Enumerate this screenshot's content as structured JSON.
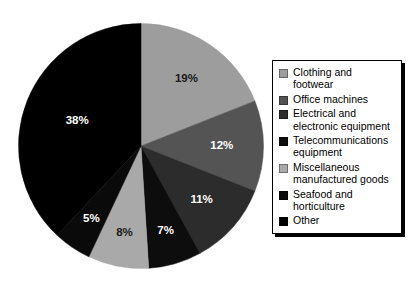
{
  "chart_data": {
    "type": "pie",
    "title": "",
    "subtitle": "",
    "xlabel": "",
    "ylabel": "",
    "grid": false,
    "legend_position": "right",
    "start_angle_deg": 0,
    "direction": "clockwise",
    "units": "percent",
    "total": 100,
    "categories": [
      "Clothing and footwear",
      "Office machines",
      "Electrical and electronic equipment",
      "Telecommunications equipment",
      "Miscellaneous manufactured goods",
      "Seafood and horticulture",
      "Other"
    ],
    "values": [
      19,
      12,
      11,
      7,
      8,
      5,
      38
    ],
    "data_labels": [
      "19%",
      "12%",
      "11%",
      "7%",
      "8%",
      "5%",
      "38%"
    ],
    "colors": [
      "#9d9d9d",
      "#545454",
      "#2c2c2c",
      "#0d0d0d",
      "#a9a9a9",
      "#0a0a0a",
      "#000000"
    ],
    "label_text_colors": [
      "#1a1a1a",
      "#ffffff",
      "#ffffff",
      "#ffffff",
      "#1a1a1a",
      "#ffffff",
      "#ffffff"
    ],
    "slices": [
      {
        "label": "Clothing and footwear",
        "value": 19,
        "data_label": "19%",
        "color": "#9d9d9d",
        "label_color": "#1a1a1a"
      },
      {
        "label": "Office machines",
        "value": 12,
        "data_label": "12%",
        "color": "#545454",
        "label_color": "#ffffff"
      },
      {
        "label": "Electrical and electronic equipment",
        "value": 11,
        "data_label": "11%",
        "color": "#2c2c2c",
        "label_color": "#ffffff"
      },
      {
        "label": "Telecommunications equipment",
        "value": 7,
        "data_label": "7%",
        "color": "#0d0d0d",
        "label_color": "#ffffff"
      },
      {
        "label": "Miscellaneous manufactured goods",
        "value": 8,
        "data_label": "8%",
        "color": "#a9a9a9",
        "label_color": "#1a1a1a"
      },
      {
        "label": "Seafood and horticulture",
        "value": 5,
        "data_label": "5%",
        "color": "#0a0a0a",
        "label_color": "#ffffff"
      },
      {
        "label": "Other",
        "value": 38,
        "data_label": "38%",
        "color": "#000000",
        "label_color": "#ffffff"
      }
    ]
  },
  "legend": {
    "items": [
      {
        "label": "Clothing and\nfootwear",
        "swatch": "#9d9d9d"
      },
      {
        "label": "Office machines",
        "swatch": "#545454"
      },
      {
        "label": "Electrical and\nelectronic equipment",
        "swatch": "#2c2c2c"
      },
      {
        "label": "Telecommunications\nequipment",
        "swatch": "#0d0d0d"
      },
      {
        "label": "Miscellaneous\nmanufactured goods",
        "swatch": "#a9a9a9"
      },
      {
        "label": "Seafood and\nhorticulture",
        "swatch": "#0a0a0a"
      },
      {
        "label": "Other",
        "swatch": "#000000"
      }
    ]
  }
}
